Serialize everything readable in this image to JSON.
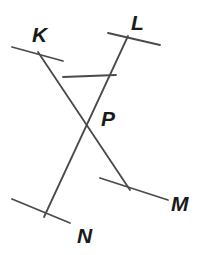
{
  "diagram": {
    "kind": "geometry-line-diagram",
    "canvas": {
      "width": 208,
      "height": 255,
      "background": "#ffffff"
    },
    "stroke": {
      "color": "#4a4a4a",
      "width": 1.8,
      "tick_width": 1.8
    },
    "label_color": "#1a1a1a",
    "label_font_size": 21,
    "labels": [
      {
        "id": "label-k",
        "text": "K",
        "x": 32,
        "y": 42
      },
      {
        "id": "label-l",
        "text": "L",
        "x": 131,
        "y": 30
      },
      {
        "id": "label-p",
        "text": "P",
        "x": 101,
        "y": 126
      },
      {
        "id": "label-m",
        "text": "M",
        "x": 171,
        "y": 211
      },
      {
        "id": "label-n",
        "text": "N",
        "x": 77,
        "y": 243
      }
    ],
    "points": {
      "P": {
        "x": 88,
        "y": 118
      },
      "K_end": {
        "x": 38,
        "y": 52
      },
      "L_end": {
        "x": 128,
        "y": 36
      },
      "M_end": {
        "x": 130,
        "y": 190
      },
      "N_end": {
        "x": 44,
        "y": 217
      },
      "triangle_left": {
        "x": 63,
        "y": 77
      },
      "triangle_right": {
        "x": 116,
        "y": 75
      }
    },
    "segments": [
      {
        "id": "ray-k-to-m",
        "name": "line-K-M",
        "x1": 38,
        "y1": 52,
        "x2": 130,
        "y2": 190
      },
      {
        "id": "ray-l-to-n",
        "name": "line-L-N",
        "x1": 128,
        "y1": 36,
        "x2": 44,
        "y2": 217
      },
      {
        "id": "segment-crossbar",
        "name": "segment-KL-connector",
        "x1": 63,
        "y1": 77,
        "x2": 116,
        "y2": 75
      }
    ],
    "tick_marks": [
      {
        "id": "tick-k",
        "name": "tick-mark-K",
        "x1": 12,
        "y1": 47,
        "x2": 63,
        "y2": 61
      },
      {
        "id": "tick-l",
        "name": "tick-mark-L",
        "x1": 108,
        "y1": 33,
        "x2": 160,
        "y2": 45
      },
      {
        "id": "tick-m",
        "name": "tick-mark-M",
        "x1": 100,
        "y1": 178,
        "x2": 168,
        "y2": 200
      },
      {
        "id": "tick-n",
        "name": "tick-mark-N",
        "x1": 12,
        "y1": 199,
        "x2": 70,
        "y2": 223
      }
    ]
  },
  "chart_data": {
    "type": "diagram",
    "title": "",
    "labels": [
      "K",
      "L",
      "P",
      "M",
      "N"
    ],
    "intersection_point": "P",
    "lines": [
      "K-M",
      "L-N"
    ]
  }
}
